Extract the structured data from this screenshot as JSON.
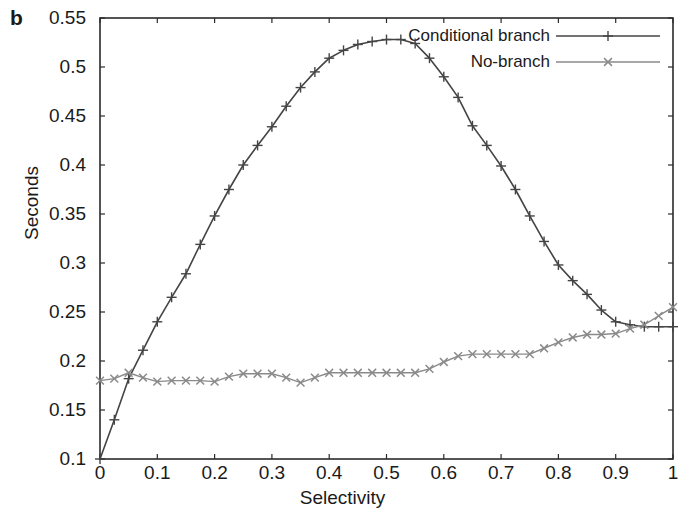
{
  "panel": {
    "letter": "b"
  },
  "chart_data": {
    "type": "line",
    "title": "",
    "xlabel": "Selectivity",
    "ylabel": "Seconds",
    "xlim": [
      0,
      1
    ],
    "ylim": [
      0.1,
      0.55
    ],
    "grid": false,
    "legend_position": "top-right",
    "xticks": [
      "0",
      "0.1",
      "0.2",
      "0.3",
      "0.4",
      "0.5",
      "0.6",
      "0.7",
      "0.8",
      "0.9",
      "1"
    ],
    "xtick_values": [
      0,
      0.1,
      0.2,
      0.3,
      0.4,
      0.5,
      0.6,
      0.7,
      0.8,
      0.9,
      1
    ],
    "yticks": [
      "0.1",
      "0.15",
      "0.2",
      "0.25",
      "0.3",
      "0.35",
      "0.4",
      "0.45",
      "0.5",
      "0.55"
    ],
    "ytick_values": [
      0.1,
      0.15,
      0.2,
      0.25,
      0.3,
      0.35,
      0.4,
      0.45,
      0.5,
      0.55
    ],
    "x": [
      0,
      0.025,
      0.05,
      0.075,
      0.1,
      0.125,
      0.15,
      0.175,
      0.2,
      0.225,
      0.25,
      0.275,
      0.3,
      0.325,
      0.35,
      0.375,
      0.4,
      0.425,
      0.45,
      0.475,
      0.5,
      0.525,
      0.55,
      0.575,
      0.6,
      0.625,
      0.65,
      0.675,
      0.7,
      0.725,
      0.75,
      0.775,
      0.8,
      0.825,
      0.85,
      0.875,
      0.9,
      0.925,
      0.95,
      0.975,
      1
    ],
    "series": [
      {
        "name": "Conditional branch",
        "marker": "plus",
        "color": "#444444",
        "values": [
          0.1,
          0.14,
          0.182,
          0.211,
          0.24,
          0.265,
          0.289,
          0.319,
          0.348,
          0.375,
          0.4,
          0.42,
          0.439,
          0.46,
          0.479,
          0.495,
          0.509,
          0.517,
          0.523,
          0.526,
          0.528,
          0.528,
          0.524,
          0.509,
          0.49,
          0.469,
          0.44,
          0.42,
          0.399,
          0.375,
          0.348,
          0.322,
          0.298,
          0.282,
          0.268,
          0.252,
          0.24,
          0.237,
          0.235,
          0.235,
          0.235
        ]
      },
      {
        "name": "No-branch",
        "marker": "cross",
        "color": "#8a8a8a",
        "values": [
          0.18,
          0.182,
          0.188,
          0.183,
          0.179,
          0.18,
          0.18,
          0.18,
          0.179,
          0.184,
          0.187,
          0.187,
          0.187,
          0.183,
          0.178,
          0.183,
          0.188,
          0.188,
          0.188,
          0.188,
          0.188,
          0.188,
          0.188,
          0.192,
          0.199,
          0.205,
          0.207,
          0.207,
          0.207,
          0.207,
          0.207,
          0.213,
          0.219,
          0.224,
          0.227,
          0.227,
          0.228,
          0.233,
          0.237,
          0.246,
          0.255
        ]
      }
    ]
  }
}
